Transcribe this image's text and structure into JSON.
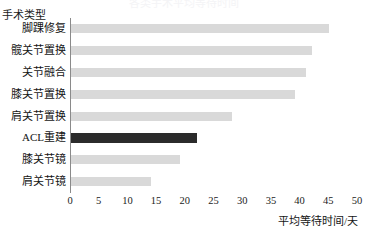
{
  "chart_data": {
    "type": "bar",
    "orientation": "horizontal",
    "title": "各类手术平均等待时间",
    "xlabel": "平均等待时间/天",
    "ylabel": "手术类型",
    "categories": [
      "脚踝修复",
      "髋关节置换",
      "关节融合",
      "膝关节置换",
      "肩关节置换",
      "ACL重建",
      "膝关节镜",
      "肩关节镜"
    ],
    "values": [
      45,
      42,
      41,
      39,
      28,
      22,
      19,
      14
    ],
    "bar_colors": [
      "#d9d9d9",
      "#d9d9d9",
      "#d9d9d9",
      "#d9d9d9",
      "#d9d9d9",
      "#2b2b2b",
      "#d9d9d9",
      "#d9d9d9"
    ],
    "highlight_category": "ACL重建",
    "highlight_color": "#2b2b2b",
    "base_color": "#d9d9d9",
    "xlim": [
      0,
      50
    ],
    "xticks": [
      0,
      5,
      10,
      15,
      20,
      25,
      30,
      35,
      40,
      45,
      50
    ],
    "xtick_labels": [
      "0",
      "5",
      "10",
      "15",
      "20",
      "25",
      "30",
      "35",
      "40",
      "45",
      "50"
    ],
    "grid": false,
    "legend": false
  }
}
